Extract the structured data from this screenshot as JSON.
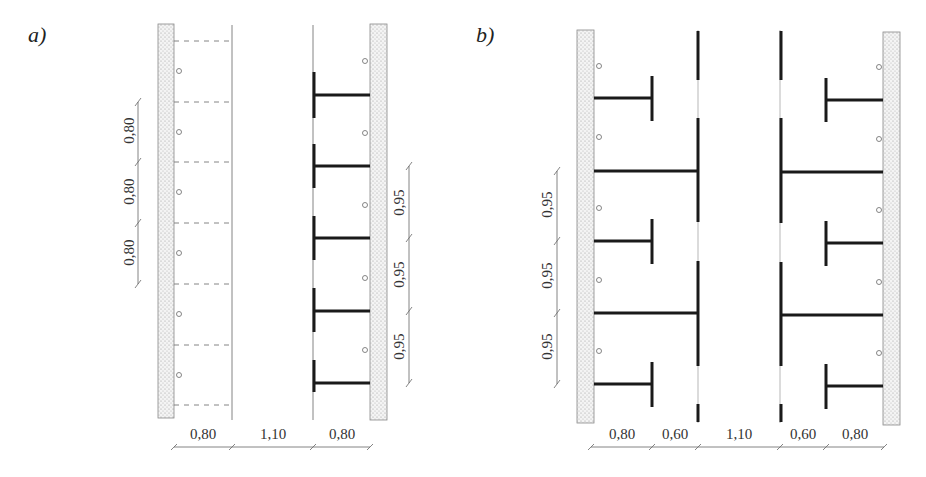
{
  "panels": [
    {
      "id": "a",
      "label": "a)",
      "bottom_dims": [
        "0,80",
        "1,10",
        "0,80"
      ],
      "left_dims": [
        "0,80",
        "0,80",
        "0,80"
      ],
      "right_dims": [
        "0,95",
        "0,95",
        "0,95"
      ]
    },
    {
      "id": "b",
      "label": "b)",
      "bottom_dims": [
        "0,80",
        "0,60",
        "1,10",
        "0,60",
        "0,80"
      ],
      "left_dims": [
        "0,95",
        "0,95",
        "0,95"
      ]
    }
  ],
  "colors": {
    "wall_fill": "#e8e8e8",
    "wall_dots": "#aaaaaa",
    "line_thin": "#777777",
    "line_thick": "#1a1a1a",
    "dim_line": "#666666"
  }
}
